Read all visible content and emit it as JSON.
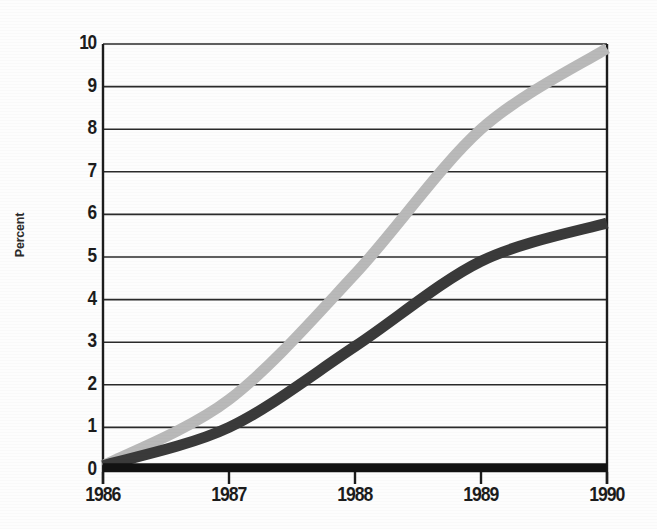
{
  "chart_data": {
    "type": "line",
    "title": "",
    "subtitle": "",
    "xlabel": "",
    "ylabel": "Percent",
    "x": [
      1986,
      1987,
      1988,
      1989,
      1990
    ],
    "categories": [
      "1986",
      "1987",
      "1988",
      "1989",
      "1990"
    ],
    "xtick_labels": [
      "1986",
      "1987",
      "1988",
      "1989",
      "1990"
    ],
    "ytick_labels": [
      "10",
      "9",
      "8",
      "7",
      "6",
      "5",
      "4",
      "3",
      "2",
      "1",
      "0"
    ],
    "ytick_values": [
      10,
      9,
      8,
      7,
      6,
      5,
      4,
      3,
      2,
      1,
      0
    ],
    "ylim": [
      0,
      10
    ],
    "xlim": [
      1986,
      1990
    ],
    "grid": true,
    "grid_axis": "y",
    "legend": false,
    "legend_position": "none",
    "series": [
      {
        "name": "light-gray-series",
        "color": "#b9b9b9",
        "values": [
          0.1,
          1.65,
          4.6,
          8.0,
          9.9
        ]
      },
      {
        "name": "dark-gray-series",
        "color": "#3a3a3a",
        "values": [
          0.1,
          1.0,
          2.9,
          4.9,
          5.8
        ]
      },
      {
        "name": "black-baseline-series",
        "color": "#121212",
        "values": [
          0.05,
          0.05,
          0.05,
          0.05,
          0.05
        ]
      }
    ]
  },
  "axes": {
    "y_title": "Percent",
    "axis_color": "#1c1c1c",
    "grid_color": "#2a2a2a"
  },
  "colors": {
    "background": "#fdfdfd",
    "text": "#1c1c1c",
    "series_light": "#b9b9b9",
    "series_dark": "#3a3a3a",
    "series_black": "#121212"
  }
}
